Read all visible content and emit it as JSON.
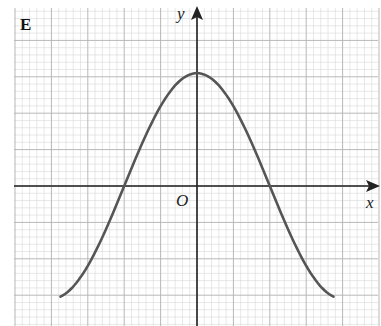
{
  "panel_label": "E",
  "axes": {
    "x_label": "x",
    "y_label": "y",
    "origin_label": "O"
  },
  "colors": {
    "background": "#ffffff",
    "minor_grid": "#d9d9d9",
    "major_grid": "#b8b8b8",
    "axis": "#222222",
    "curve": "#555555"
  },
  "chart_data": {
    "type": "line",
    "title": "E",
    "xlabel": "x",
    "ylabel": "y",
    "grid": true,
    "legend": null,
    "annotations": [
      "O"
    ],
    "xlim": [
      -5.1,
      5.0
    ],
    "ylim": [
      -3.8,
      5.0
    ],
    "series": [
      {
        "name": "curve",
        "x": [
          -3.75,
          -3.0,
          -2.5,
          -2.0,
          -1.5,
          -1.0,
          -0.5,
          0,
          0.5,
          1.0,
          1.5,
          2.0,
          2.5,
          3.0,
          3.75
        ],
        "y": [
          -3.05,
          -2.2,
          -1.2,
          0.0,
          1.2,
          2.2,
          2.9,
          3.1,
          2.9,
          2.2,
          1.2,
          0.0,
          -1.2,
          -2.2,
          -3.05
        ]
      }
    ],
    "key_points": {
      "maximum": [
        0,
        3.1
      ],
      "x_intercepts": [
        -2.0,
        2.0
      ],
      "endpoints": [
        [
          -3.75,
          -3.05
        ],
        [
          3.75,
          -3.05
        ]
      ]
    }
  }
}
